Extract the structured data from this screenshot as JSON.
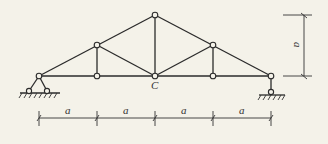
{
  "diagram": {
    "type": "truss",
    "node_label_center": "C",
    "panel_dimension_labels": [
      "a",
      "a",
      "a",
      "a"
    ],
    "height_dimension_label": "a",
    "colors": {
      "line": "#2b2b2b",
      "background": "#f4f2e9"
    },
    "nodes": [
      {
        "id": "A",
        "x": 39,
        "y": 76
      },
      {
        "id": "B1",
        "x": 97,
        "y": 76
      },
      {
        "id": "C",
        "x": 155,
        "y": 76
      },
      {
        "id": "B2",
        "x": 213,
        "y": 76
      },
      {
        "id": "D",
        "x": 271,
        "y": 76
      },
      {
        "id": "T1",
        "x": 97,
        "y": 45
      },
      {
        "id": "T",
        "x": 155,
        "y": 15
      },
      {
        "id": "T2",
        "x": 213,
        "y": 45
      }
    ],
    "supports": [
      {
        "type": "pin",
        "node": "A"
      },
      {
        "type": "roller",
        "node": "D"
      }
    ]
  }
}
